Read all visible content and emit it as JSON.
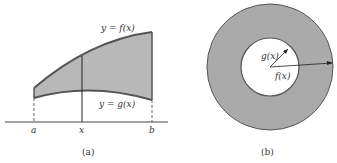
{
  "panel_a": {
    "caption": "(a)",
    "upper_curve_label": "y = f(x)",
    "lower_curve_label": "y = g(x)",
    "axis_labels": {
      "a": "a",
      "x": "x",
      "b": "b"
    },
    "colors": {
      "fill": "#b5b5b5",
      "curve": "#555555",
      "axis": "#444444"
    }
  },
  "panel_b": {
    "caption": "(b)",
    "inner_radius_label": "g(x)",
    "outer_radius_label": "f(x)",
    "colors": {
      "ring": "#a9a9a9",
      "edge": "#555555",
      "hole": "#ffffff"
    }
  }
}
